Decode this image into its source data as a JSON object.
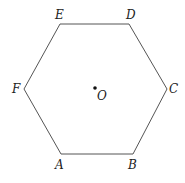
{
  "diagram": {
    "type": "regular-hexagon",
    "stroke_color": "#555555",
    "vertices": [
      {
        "label": "A",
        "x": 61,
        "y": 154,
        "lx": 55,
        "ly": 169
      },
      {
        "label": "B",
        "x": 133,
        "y": 154,
        "lx": 128,
        "ly": 169
      },
      {
        "label": "C",
        "x": 167,
        "y": 89,
        "lx": 169,
        "ly": 93
      },
      {
        "label": "D",
        "x": 129,
        "y": 24,
        "lx": 126,
        "ly": 19
      },
      {
        "label": "E",
        "x": 60,
        "y": 24,
        "lx": 55,
        "ly": 19
      },
      {
        "label": "F",
        "x": 24,
        "y": 89,
        "lx": 12,
        "ly": 93
      }
    ],
    "center": {
      "label": "O",
      "x": 95,
      "y": 88,
      "lx": 97,
      "ly": 100
    }
  }
}
